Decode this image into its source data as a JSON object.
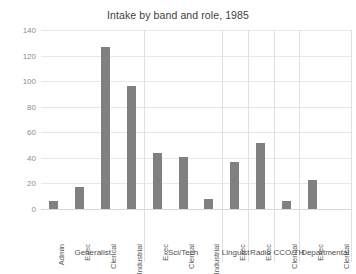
{
  "chart_data": {
    "type": "bar",
    "title": "Intake by band and role, 1985",
    "xlabel": "",
    "ylabel": "",
    "ylim": [
      0,
      140
    ],
    "yticks": [
      0,
      20,
      40,
      60,
      80,
      100,
      120,
      140
    ],
    "grid": true,
    "legend": "none",
    "bar_color": "#808080",
    "categories": [
      "Admin",
      "Exec",
      "Clerical",
      "Industrial",
      "Exec",
      "Clerical",
      "Industrial",
      "Exec",
      "Exec",
      "Clerical",
      "Exec",
      "Clerical"
    ],
    "values": [
      6,
      17,
      127,
      96,
      44,
      41,
      8,
      37,
      52,
      6,
      23,
      0
    ],
    "groups": [
      {
        "label": "Generalist",
        "span": 4,
        "roles": [
          "Admin",
          "Exec",
          "Clerical",
          "Industrial"
        ],
        "values": [
          6,
          17,
          127,
          96
        ]
      },
      {
        "label": "Sci/Tech",
        "span": 3,
        "roles": [
          "Exec",
          "Clerical",
          "Industrial"
        ],
        "values": [
          44,
          41,
          8
        ]
      },
      {
        "label": "Linguist",
        "span": 1,
        "roles": [
          "Exec"
        ],
        "values": [
          37
        ]
      },
      {
        "label": "Radio",
        "span": 1,
        "roles": [
          "Exec"
        ],
        "values": [
          52
        ]
      },
      {
        "label": "CCO/TH",
        "span": 1,
        "roles": [
          "Clerical"
        ],
        "values": [
          6
        ]
      },
      {
        "label": "Departmental",
        "span": 2,
        "roles": [
          "Exec",
          "Clerical"
        ],
        "values": [
          23,
          0
        ]
      }
    ]
  }
}
